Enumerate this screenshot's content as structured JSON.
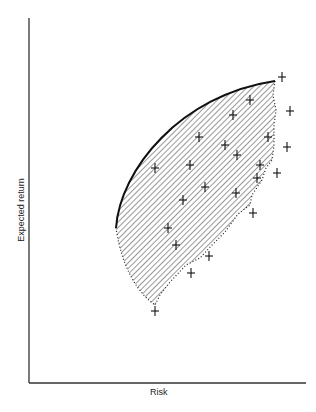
{
  "chart_data": {
    "type": "scatter",
    "title": "",
    "xlabel": "Risk",
    "ylabel": "Expected return",
    "grid": false,
    "legend": null,
    "annotations": [
      "Efficient frontier (solid curve, upper-left boundary)",
      "Shaded feasible region of portfolios",
      "Individual securities marked with +"
    ],
    "points_pixel": [
      [
        282,
        77
      ],
      [
        290,
        111
      ],
      [
        287,
        147
      ],
      [
        277,
        173
      ],
      [
        268,
        137
      ],
      [
        257,
        178
      ],
      [
        250,
        100
      ],
      [
        233,
        115
      ],
      [
        225,
        145
      ],
      [
        237,
        155
      ],
      [
        260,
        165
      ],
      [
        199,
        137
      ],
      [
        190,
        165
      ],
      [
        155,
        168
      ],
      [
        183,
        200
      ],
      [
        205,
        187
      ],
      [
        168,
        228
      ],
      [
        176,
        245
      ],
      [
        236,
        193
      ],
      [
        253,
        213
      ],
      [
        209,
        256
      ],
      [
        191,
        273
      ],
      [
        155,
        311
      ]
    ]
  },
  "labels": {
    "x_axis": "Risk",
    "y_axis": "Expected return",
    "caption": "Figure 8.4"
  }
}
